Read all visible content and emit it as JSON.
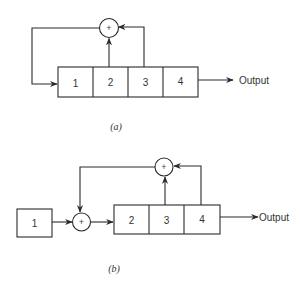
{
  "diagram_a": {
    "caption": "(a)",
    "register_cells": [
      "1",
      "2",
      "3",
      "4"
    ],
    "adder_symbol": "+",
    "output_label": "Output",
    "feedback_taps": [
      "2",
      "3"
    ],
    "feedback_target": "1"
  },
  "diagram_b": {
    "caption": "(b)",
    "input_cell": "1",
    "register_cells": [
      "2",
      "3",
      "4"
    ],
    "input_adder_symbol": "+",
    "feedback_adder_symbol": "+",
    "output_label": "Output",
    "feedback_taps": [
      "3",
      "4"
    ]
  }
}
